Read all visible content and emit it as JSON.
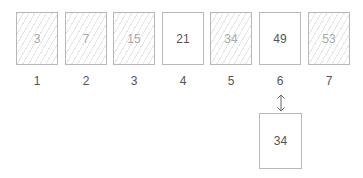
{
  "array": {
    "cells": [
      {
        "index": "1",
        "value": "3",
        "hatched": true
      },
      {
        "index": "2",
        "value": "7",
        "hatched": true
      },
      {
        "index": "3",
        "value": "15",
        "hatched": true
      },
      {
        "index": "4",
        "value": "21",
        "hatched": false
      },
      {
        "index": "5",
        "value": "34",
        "hatched": true
      },
      {
        "index": "6",
        "value": "49",
        "hatched": false
      },
      {
        "index": "7",
        "value": "53",
        "hatched": true
      }
    ]
  },
  "comparison": {
    "target_value": "34",
    "compared_index": "6",
    "arrow_icon": "up-down-arrow-icon"
  },
  "colors": {
    "border": "#b8b8b8",
    "text": "#555555",
    "hatched_text": "#aaaaaa",
    "hatch": "#e6e6e6"
  }
}
